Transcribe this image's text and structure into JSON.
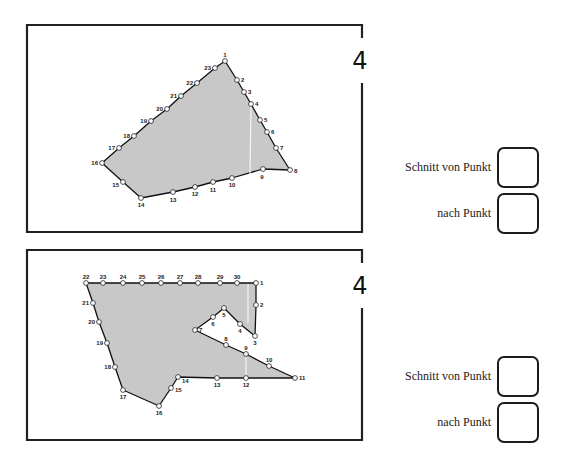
{
  "exercises": [
    {
      "number": "4",
      "frame": {
        "x": 27,
        "y": 25,
        "w": 335,
        "h": 207
      },
      "number_pos": {
        "x": 360,
        "y": 69
      },
      "fill_color": "#c8c8c8",
      "points": [
        {
          "n": "1",
          "x": 225,
          "y": 61,
          "lx": 225,
          "ly": 57,
          "a": "middle"
        },
        {
          "n": "2",
          "x": 237,
          "y": 80,
          "lx": 241,
          "ly": 82,
          "a": "start"
        },
        {
          "n": "3",
          "x": 244,
          "y": 92,
          "lx": 248,
          "ly": 94,
          "a": "start"
        },
        {
          "n": "4",
          "x": 251,
          "y": 104,
          "lx": 255,
          "ly": 106,
          "a": "start"
        },
        {
          "n": "5",
          "x": 260,
          "y": 120,
          "lx": 264,
          "ly": 122,
          "a": "start"
        },
        {
          "n": "6",
          "x": 267,
          "y": 132,
          "lx": 271,
          "ly": 134,
          "a": "start"
        },
        {
          "n": "7",
          "x": 276,
          "y": 148,
          "lx": 280,
          "ly": 150,
          "a": "start"
        },
        {
          "n": "8",
          "x": 290,
          "y": 170,
          "lx": 294,
          "ly": 173,
          "a": "start"
        },
        {
          "n": "9",
          "x": 263,
          "y": 169,
          "lx": 262,
          "ly": 179,
          "a": "middle"
        },
        {
          "n": "10",
          "x": 232,
          "y": 178,
          "lx": 232,
          "ly": 187,
          "a": "middle"
        },
        {
          "n": "11",
          "x": 213,
          "y": 182,
          "lx": 213,
          "ly": 192,
          "a": "middle"
        },
        {
          "n": "12",
          "x": 195,
          "y": 187,
          "lx": 195,
          "ly": 196,
          "a": "middle"
        },
        {
          "n": "13",
          "x": 173,
          "y": 192,
          "lx": 173,
          "ly": 202,
          "a": "middle"
        },
        {
          "n": "14",
          "x": 141,
          "y": 198,
          "lx": 141,
          "ly": 207,
          "a": "middle"
        },
        {
          "n": "15",
          "x": 123,
          "y": 182,
          "lx": 119,
          "ly": 187,
          "a": "end"
        },
        {
          "n": "16",
          "x": 102,
          "y": 163,
          "lx": 98,
          "ly": 165,
          "a": "end"
        },
        {
          "n": "17",
          "x": 119,
          "y": 148,
          "lx": 115,
          "ly": 150,
          "a": "end"
        },
        {
          "n": "18",
          "x": 134,
          "y": 136,
          "lx": 130,
          "ly": 138,
          "a": "end"
        },
        {
          "n": "19",
          "x": 151,
          "y": 121,
          "lx": 147,
          "ly": 123,
          "a": "end"
        },
        {
          "n": "20",
          "x": 167,
          "y": 109,
          "lx": 163,
          "ly": 111,
          "a": "end"
        },
        {
          "n": "21",
          "x": 181,
          "y": 96,
          "lx": 177,
          "ly": 98,
          "a": "end"
        },
        {
          "n": "22",
          "x": 197,
          "y": 83,
          "lx": 193,
          "ly": 85,
          "a": "end"
        },
        {
          "n": "23",
          "x": 215,
          "y": 68,
          "lx": 211,
          "ly": 70,
          "a": "end"
        }
      ],
      "cut_line": {
        "x1": 251,
        "y1": 104,
        "x2": 250,
        "y2": 174
      },
      "answer": {
        "from_label": "Schnitt von Punkt",
        "to_label": "nach Punkt",
        "from_value": "",
        "to_value": "",
        "top": 147
      }
    },
    {
      "number": "4",
      "frame": {
        "x": 27,
        "y": 250,
        "w": 335,
        "h": 190
      },
      "number_pos": {
        "x": 360,
        "y": 294
      },
      "fill_color": "#c8c8c8",
      "points": [
        {
          "n": "1",
          "x": 256,
          "y": 283,
          "lx": 260,
          "ly": 285,
          "a": "start"
        },
        {
          "n": "2",
          "x": 256,
          "y": 305,
          "lx": 260,
          "ly": 307,
          "a": "start"
        },
        {
          "n": "3",
          "x": 255,
          "y": 336,
          "lx": 255,
          "ly": 345,
          "a": "middle"
        },
        {
          "n": "4",
          "x": 240,
          "y": 324,
          "lx": 240,
          "ly": 333,
          "a": "middle"
        },
        {
          "n": "5",
          "x": 224,
          "y": 308,
          "lx": 224,
          "ly": 317,
          "a": "middle"
        },
        {
          "n": "6",
          "x": 213,
          "y": 317,
          "lx": 213,
          "ly": 326,
          "a": "middle"
        },
        {
          "n": "7",
          "x": 195,
          "y": 330,
          "lx": 199,
          "ly": 332,
          "a": "start"
        },
        {
          "n": "8",
          "x": 226,
          "y": 345,
          "lx": 226,
          "ly": 341,
          "a": "middle"
        },
        {
          "n": "9",
          "x": 246,
          "y": 354,
          "lx": 246,
          "ly": 350,
          "a": "middle"
        },
        {
          "n": "10",
          "x": 269,
          "y": 366,
          "lx": 269,
          "ly": 362,
          "a": "middle"
        },
        {
          "n": "11",
          "x": 295,
          "y": 378,
          "lx": 299,
          "ly": 380,
          "a": "start"
        },
        {
          "n": "12",
          "x": 246,
          "y": 378,
          "lx": 246,
          "ly": 387,
          "a": "middle"
        },
        {
          "n": "13",
          "x": 217,
          "y": 378,
          "lx": 217,
          "ly": 387,
          "a": "middle"
        },
        {
          "n": "14",
          "x": 178,
          "y": 377,
          "lx": 182,
          "ly": 383,
          "a": "start"
        },
        {
          "n": "15",
          "x": 171,
          "y": 388,
          "lx": 175,
          "ly": 392,
          "a": "start"
        },
        {
          "n": "16",
          "x": 159,
          "y": 406,
          "lx": 159,
          "ly": 415,
          "a": "middle"
        },
        {
          "n": "17",
          "x": 123,
          "y": 390,
          "lx": 123,
          "ly": 399,
          "a": "middle"
        },
        {
          "n": "18",
          "x": 115,
          "y": 367,
          "lx": 111,
          "ly": 369,
          "a": "end"
        },
        {
          "n": "19",
          "x": 107,
          "y": 343,
          "lx": 103,
          "ly": 345,
          "a": "end"
        },
        {
          "n": "20",
          "x": 99,
          "y": 322,
          "lx": 95,
          "ly": 324,
          "a": "end"
        },
        {
          "n": "21",
          "x": 93,
          "y": 303,
          "lx": 89,
          "ly": 305,
          "a": "end"
        },
        {
          "n": "22",
          "x": 86,
          "y": 283,
          "lx": 86,
          "ly": 279,
          "a": "middle"
        },
        {
          "n": "23",
          "x": 103,
          "y": 283,
          "lx": 103,
          "ly": 279,
          "a": "middle"
        },
        {
          "n": "24",
          "x": 123,
          "y": 283,
          "lx": 123,
          "ly": 279,
          "a": "middle"
        },
        {
          "n": "25",
          "x": 142,
          "y": 283,
          "lx": 142,
          "ly": 279,
          "a": "middle"
        },
        {
          "n": "26",
          "x": 161,
          "y": 283,
          "lx": 161,
          "ly": 279,
          "a": "middle"
        },
        {
          "n": "27",
          "x": 180,
          "y": 283,
          "lx": 180,
          "ly": 279,
          "a": "middle"
        },
        {
          "n": "28",
          "x": 198,
          "y": 283,
          "lx": 198,
          "ly": 279,
          "a": "middle"
        },
        {
          "n": "29",
          "x": 220,
          "y": 283,
          "lx": 220,
          "ly": 279,
          "a": "middle"
        },
        {
          "n": "30",
          "x": 237,
          "y": 283,
          "lx": 237,
          "ly": 279,
          "a": "middle"
        }
      ],
      "cut_line": {
        "x1": 246,
        "y1": 354,
        "x2": 246,
        "y2": 378
      },
      "cut_line_2": {
        "x1": 248,
        "y1": 284,
        "x2": 248,
        "y2": 323
      },
      "answer": {
        "from_label": "Schnitt von Punkt",
        "to_label": "nach Punkt",
        "from_value": "",
        "to_value": "",
        "top": 356
      }
    }
  ]
}
